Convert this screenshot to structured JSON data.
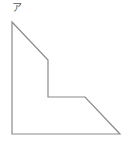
{
  "figure": {
    "label": "ア",
    "shape": "concave hexagon (L-shaped stepped polygon)",
    "stroke_color": "#8a8a8a",
    "fill_color": "#ffffff",
    "vertices": [
      [
        12,
        22
      ],
      [
        48,
        60
      ],
      [
        48,
        97
      ],
      [
        85,
        97
      ],
      [
        120,
        134
      ],
      [
        12,
        134
      ]
    ]
  }
}
